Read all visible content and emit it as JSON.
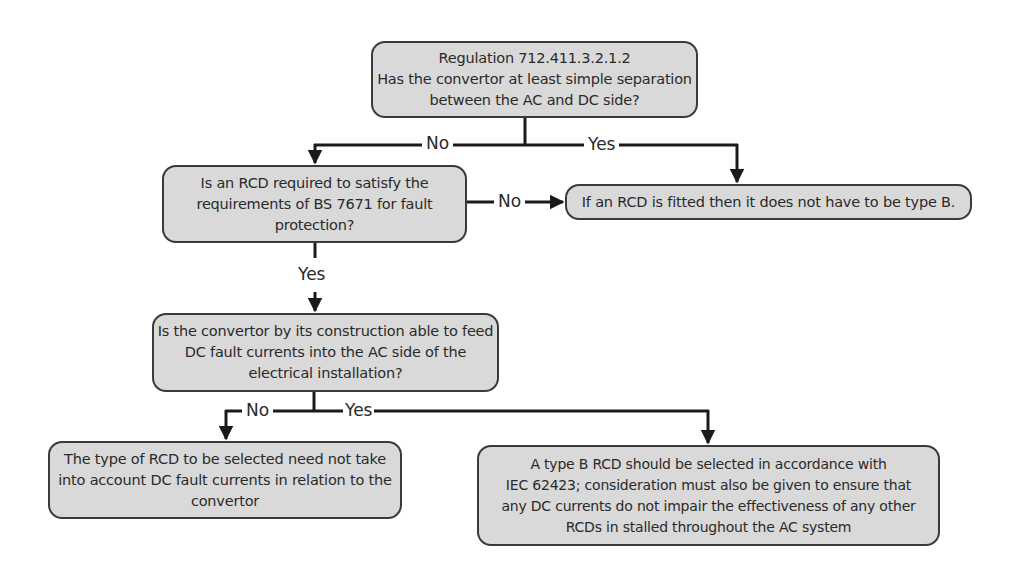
{
  "diagram": {
    "type": "flowchart",
    "nodes": [
      {
        "id": "q1",
        "kind": "decision",
        "lines": [
          "Regulation 712.411.3.2.1.2",
          "Has the convertor at least simple separation",
          "between the AC and DC side?"
        ]
      },
      {
        "id": "q2",
        "kind": "decision",
        "lines": [
          "Is an RCD required to satisfy the",
          "requirements of BS 7671 for fault",
          "protection?"
        ]
      },
      {
        "id": "r1",
        "kind": "outcome",
        "lines": [
          "If an RCD is fitted then it does not have to be type B."
        ]
      },
      {
        "id": "q3",
        "kind": "decision",
        "lines": [
          "Is the convertor by its construction able to feed",
          "DC fault currents into the AC side of the",
          "electrical installation?"
        ]
      },
      {
        "id": "r2",
        "kind": "outcome",
        "lines": [
          "The type of RCD to be selected need not take",
          "into account DC fault currents in relation to the",
          "convertor"
        ]
      },
      {
        "id": "r3",
        "kind": "outcome",
        "lines": [
          "A type B RCD should be selected in accordance with",
          "IEC 62423; consideration must also be given to ensure that",
          "any DC currents do not impair the effectiveness of any other",
          "RCDs in stalled throughout the AC system"
        ]
      }
    ],
    "edges": [
      {
        "from": "q1",
        "to": "q2",
        "label": "No"
      },
      {
        "from": "q1",
        "to": "r1",
        "label": "Yes"
      },
      {
        "from": "q2",
        "to": "r1",
        "label": "No"
      },
      {
        "from": "q2",
        "to": "q3",
        "label": "Yes"
      },
      {
        "from": "q3",
        "to": "r2",
        "label": "No"
      },
      {
        "from": "q3",
        "to": "r3",
        "label": "Yes"
      }
    ]
  },
  "colors": {
    "box_fill": "#d9d9d9",
    "box_border": "#3a3a3a",
    "line": "#1a1a1a",
    "text": "#2a2a2a"
  }
}
